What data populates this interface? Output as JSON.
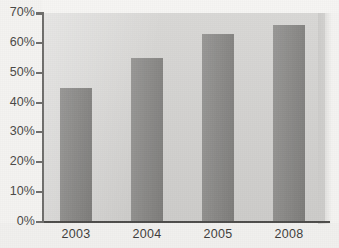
{
  "chart_data": {
    "type": "bar",
    "title": "",
    "subtitle": "",
    "xlabel": "",
    "ylabel": "",
    "categories": [
      "2003",
      "2004",
      "2005",
      "2008"
    ],
    "values": [
      45,
      55,
      63,
      66
    ],
    "value_labels": [
      "45%",
      "55%",
      "63%",
      "66%"
    ],
    "series": [
      {
        "name": "",
        "values": [
          45,
          55,
          63,
          66
        ]
      }
    ],
    "ylim": [
      0,
      70
    ],
    "y_tick_step": 10,
    "y_tick_labels": [
      "70%",
      "60%",
      "50%",
      "40%",
      "30%",
      "20%",
      "10%",
      "0%"
    ],
    "y_tick_values": [
      70,
      60,
      50,
      40,
      30,
      20,
      10,
      0
    ],
    "x_tick_labels": [
      "2003",
      "2004",
      "2005",
      "2008"
    ],
    "grid": false,
    "legend": false,
    "legend_position": "none",
    "annotations": [],
    "colors": {
      "bar_fill": "#8a8987",
      "plot_background": "#d4d3d1",
      "page_background": "#f4f3f1",
      "axis_line": "#5a5957",
      "tick_label": "#4a4947"
    }
  },
  "axes": {
    "y_ticks": [
      {
        "label": "70%",
        "value": 70
      },
      {
        "label": "60%",
        "value": 60
      },
      {
        "label": "50%",
        "value": 50
      },
      {
        "label": "40%",
        "value": 40
      },
      {
        "label": "30%",
        "value": 30
      },
      {
        "label": "20%",
        "value": 20
      },
      {
        "label": "10%",
        "value": 10
      },
      {
        "label": "0%",
        "value": 0
      }
    ],
    "x_ticks": [
      {
        "label": "2003"
      },
      {
        "label": "2004"
      },
      {
        "label": "2005"
      },
      {
        "label": "2008"
      }
    ]
  },
  "bars": [
    {
      "category": "2003",
      "value": 45
    },
    {
      "category": "2004",
      "value": 55
    },
    {
      "category": "2005",
      "value": 63
    },
    {
      "category": "2008",
      "value": 66
    }
  ]
}
